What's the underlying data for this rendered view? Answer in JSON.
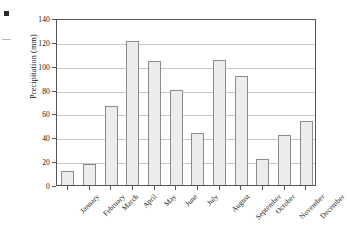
{
  "figure": {
    "background": "#ffffff",
    "frame_color": "#555555",
    "grid_color": "#c9c9c9",
    "bar_fill": "#ececec",
    "bar_stroke": "#8c8c8c"
  },
  "artifacts": {
    "square_marker": "scan-artifact-square",
    "dash_marker": "scan-artifact-dash"
  },
  "chart_data": {
    "type": "bar",
    "title": "",
    "xlabel": "",
    "ylabel": "Precipitation (mm)",
    "categories": [
      "January",
      "February",
      "March",
      "April",
      "May",
      "June",
      "July",
      "August",
      "September",
      "October",
      "November",
      "December"
    ],
    "values": [
      12,
      18,
      66,
      121,
      104,
      80,
      44,
      105,
      91,
      22,
      42,
      54
    ],
    "ylim": [
      0,
      140
    ],
    "yticks": [
      0,
      20,
      40,
      60,
      80,
      100,
      120,
      140
    ],
    "ytick_labels": [
      "0",
      "20",
      "40",
      "60",
      "80",
      "100",
      "120",
      "140"
    ],
    "grid": true,
    "grid_axis": "y",
    "legend": false,
    "legend_position": "none"
  }
}
